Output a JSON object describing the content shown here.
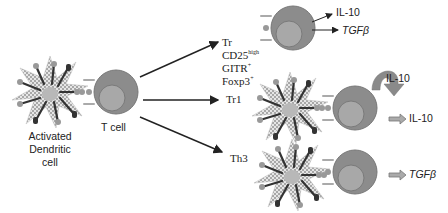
{
  "diagram": {
    "source_cell": {
      "dendritic_label_line1": "Activated",
      "dendritic_label_line2": "Dendritic",
      "dendritic_label_line3": "cell",
      "t_cell_label": "T cell"
    },
    "branches": [
      {
        "name": "Tr",
        "markers": [
          {
            "base": "CD25",
            "sup": "high"
          },
          {
            "base": "GITR",
            "sup": "+"
          },
          {
            "base": "Foxp3",
            "sup": "+"
          }
        ],
        "outputs": [
          "IL-10",
          "TGFβ"
        ]
      },
      {
        "name": "Tr1",
        "autocrine_label": "IL-10",
        "output": "IL-10"
      },
      {
        "name": "Th3",
        "output": "TGFβ"
      }
    ],
    "colors": {
      "cell_outer": "#8c8c8c",
      "cell_inner": "#a6a6a6",
      "dc_checker": "#bdbdbd",
      "receptor_dark": "#333333",
      "receptor_light": "#9a9a9a",
      "arrow": "#222222",
      "hollow_arrow": "#888888"
    }
  }
}
